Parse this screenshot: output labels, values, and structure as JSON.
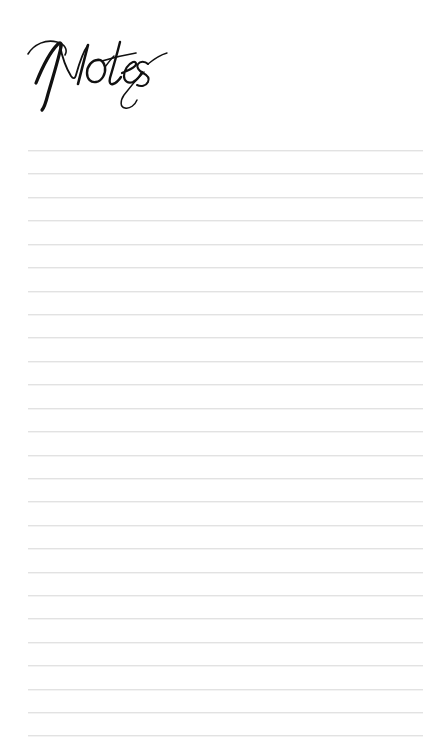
{
  "page": {
    "kind": "notes-page",
    "title": "Notes",
    "background_color": "#ffffff",
    "width": 444,
    "height": 752
  },
  "heading": {
    "text": "Notes",
    "style": "calligraphic-script",
    "ink_color": "#111111",
    "left": 30,
    "top": 38,
    "width": 98,
    "height": 57
  },
  "ruled_area": {
    "line_color": "#e2e2e2",
    "line_thickness": 1,
    "line_left": 28,
    "line_right": 423,
    "line_width": 395,
    "first_line_y": 150,
    "line_spacing": 23.4,
    "line_count": 26,
    "lines": [
      {
        "index": 1,
        "y": 150
      },
      {
        "index": 2,
        "y": 173
      },
      {
        "index": 3,
        "y": 197
      },
      {
        "index": 4,
        "y": 220
      },
      {
        "index": 5,
        "y": 244
      },
      {
        "index": 6,
        "y": 267
      },
      {
        "index": 7,
        "y": 291
      },
      {
        "index": 8,
        "y": 314
      },
      {
        "index": 9,
        "y": 337
      },
      {
        "index": 10,
        "y": 361
      },
      {
        "index": 11,
        "y": 384
      },
      {
        "index": 12,
        "y": 408
      },
      {
        "index": 13,
        "y": 431
      },
      {
        "index": 14,
        "y": 455
      },
      {
        "index": 15,
        "y": 478
      },
      {
        "index": 16,
        "y": 501
      },
      {
        "index": 17,
        "y": 525
      },
      {
        "index": 18,
        "y": 548
      },
      {
        "index": 19,
        "y": 572
      },
      {
        "index": 20,
        "y": 595
      },
      {
        "index": 21,
        "y": 618
      },
      {
        "index": 22,
        "y": 642
      },
      {
        "index": 23,
        "y": 665
      },
      {
        "index": 24,
        "y": 689
      },
      {
        "index": 25,
        "y": 712
      },
      {
        "index": 26,
        "y": 735
      }
    ]
  }
}
